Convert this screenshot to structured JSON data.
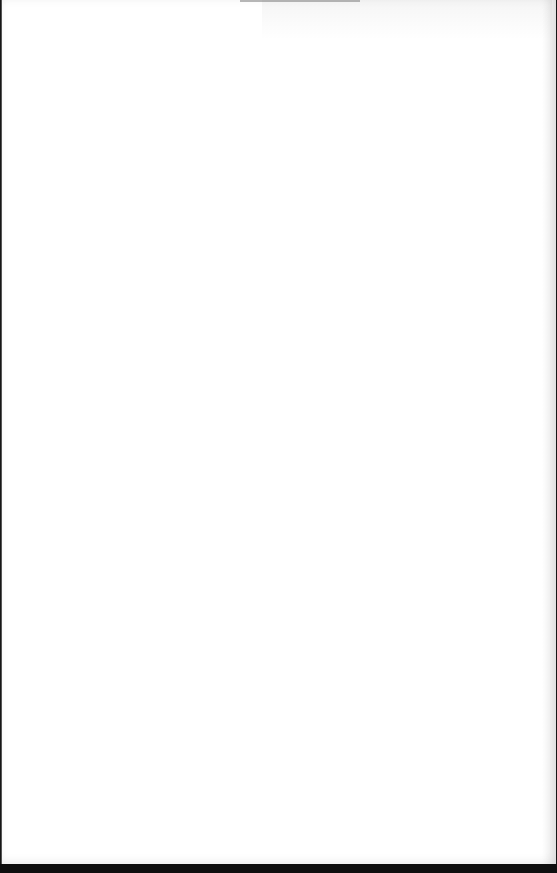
{
  "scene": {
    "subject": "blank white sheet of paper",
    "paper_color": "#ffffff",
    "edge_color": "#161616"
  }
}
